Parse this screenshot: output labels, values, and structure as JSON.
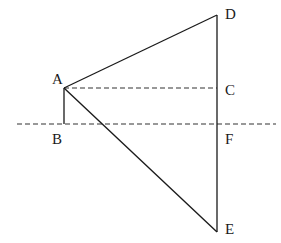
{
  "diagram": {
    "points": {
      "A": {
        "label": "A",
        "x": 64,
        "y": 88
      },
      "B": {
        "label": "B",
        "x": 64,
        "y": 124
      },
      "C": {
        "label": "C",
        "x": 217,
        "y": 88
      },
      "D": {
        "label": "D",
        "x": 217,
        "y": 15
      },
      "E": {
        "label": "E",
        "x": 217,
        "y": 232
      },
      "F": {
        "label": "F",
        "x": 217,
        "y": 124
      }
    },
    "segments": [
      {
        "from": "A",
        "to": "D",
        "style": "solid"
      },
      {
        "from": "A",
        "to": "E",
        "style": "solid"
      },
      {
        "from": "A",
        "to": "B",
        "style": "solid"
      },
      {
        "from": "D",
        "to": "E",
        "style": "solid"
      },
      {
        "from": "A",
        "to": "C",
        "style": "dashed"
      }
    ],
    "horizontal_line": {
      "y": 124,
      "x_start": 17,
      "x_end": 276,
      "style": "dashed",
      "passes_through": [
        "B",
        "F"
      ]
    },
    "colors": {
      "line": "#1a1a1a",
      "dashed": "#333333",
      "background": "#ffffff"
    }
  }
}
